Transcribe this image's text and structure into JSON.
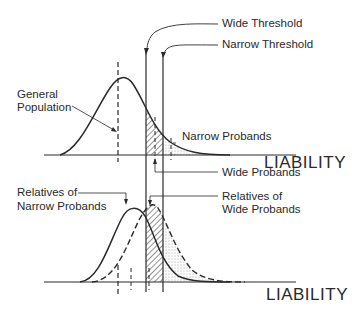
{
  "labels": {
    "wide_threshold": "Wide Threshold",
    "narrow_threshold": "Narrow Threshold",
    "general_population_1": "General",
    "general_population_2": "Population",
    "narrow_probands": "Narrow Probands",
    "wide_probands": "Wide Probands",
    "relatives_narrow_1": "Relatives of",
    "relatives_narrow_2": "Narrow Probands",
    "relatives_wide_1": "Relatives of",
    "relatives_wide_2": "Wide Probands",
    "axis_top": "LIABILITY",
    "axis_bottom": "LIABILITY"
  },
  "colors": {
    "ink": "#2a2a2a",
    "background": "#ffffff"
  }
}
